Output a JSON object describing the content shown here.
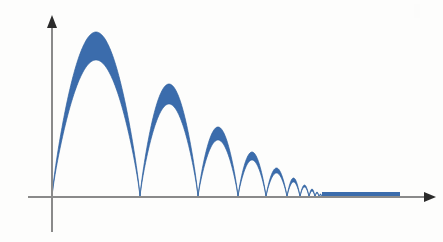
{
  "figure": {
    "background_color": "#fdfdfc",
    "width": 443,
    "height": 242
  },
  "axes": {
    "x_axis": {
      "name": "horizontal-axis",
      "color": "#8a8a8a",
      "origin_x": 52,
      "y": 197,
      "x_start": 28,
      "x_end": 430,
      "stroke_width": 2,
      "arrow_head": true,
      "arrow_color": "#2b2b2b",
      "label": ""
    },
    "y_axis": {
      "name": "vertical-axis",
      "color": "#8a8a8a",
      "x": 52,
      "y_top": 20,
      "y_bottom": 232,
      "stroke_width": 2,
      "arrow_head": true,
      "arrow_color": "#2b2b2b",
      "label": ""
    },
    "tick_labels_x": [],
    "tick_labels_y": [],
    "grid": false
  },
  "style": {
    "band_fill_color": "#3b6cac",
    "band_stroke_color": "#31619f",
    "tail_bar_color": "#3b6cac",
    "axis_gray": "#8a8a8a",
    "arrow_black": "#2b2b2b"
  },
  "chart_data": {
    "type": "area",
    "xlabel": "",
    "ylabel": "",
    "xlim": [
      0,
      1
    ],
    "ylim": [
      0,
      1
    ],
    "grid": false,
    "legend": "none",
    "series": [
      {
        "name": "outer envelope",
        "peak_amplitudes_px": [
          165,
          113,
          70,
          45,
          29,
          19,
          12,
          8,
          5,
          3
        ],
        "peak_y_px": [
          32,
          84,
          127,
          152,
          168,
          178,
          185,
          189,
          192,
          194
        ]
      },
      {
        "name": "inner envelope",
        "peak_amplitudes_px": [
          137,
          93,
          57,
          37,
          24,
          15,
          10,
          6,
          4,
          2
        ],
        "peak_y_px": [
          60,
          104,
          140,
          160,
          173,
          182,
          187,
          191,
          193,
          195
        ]
      }
    ],
    "zero_crossings_px": [
      52,
      140,
      198,
      238,
      266,
      287,
      300,
      309,
      315,
      319,
      322
    ],
    "lobe_peak_x_px": [
      96,
      169,
      218,
      252,
      277,
      294,
      305,
      312,
      317,
      320
    ],
    "lobe_count": 10,
    "tail": {
      "name": "merged-tail-bar",
      "x_start_px": 322,
      "x_end_px": 400,
      "thickness_px": 5,
      "baseline_y_px": 197
    },
    "baseline_y_px": 197,
    "x_origin_px": 52
  }
}
